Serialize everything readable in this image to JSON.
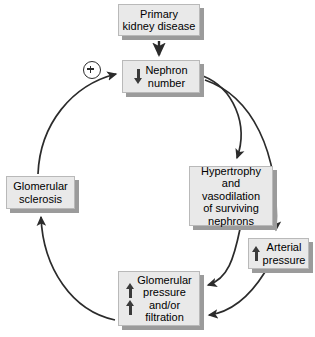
{
  "diagram": {
    "background_color": "#ffffff",
    "node_fill": "#e9e9e9",
    "node_shadow": "#9b9b9b",
    "arrow_color": "#2b2b2b",
    "nodes": [
      {
        "id": "primary",
        "label": "Primary\nkidney disease",
        "change_glyphs": []
      },
      {
        "id": "nephron",
        "label": "Nephron\nnumber",
        "change_glyphs": [
          "down"
        ]
      },
      {
        "id": "hypertrophy",
        "label": "Hypertrophy\nand vasodilation\nof surviving\nnephrons",
        "change_glyphs": []
      },
      {
        "id": "arterial",
        "label": "Arterial\npressure",
        "change_glyphs": [
          "up"
        ]
      },
      {
        "id": "glomerular_pressure",
        "label": "Glomerular\npressure\nand/or\nfiltration",
        "change_glyphs": [
          "up",
          "up"
        ]
      },
      {
        "id": "sclerosis",
        "label": "Glomerular\nsclerosis",
        "change_glyphs": []
      }
    ],
    "symbols": [
      {
        "id": "positive-feedback",
        "name": "plus-circle",
        "label": "+"
      }
    ],
    "edges": [
      {
        "from": "primary",
        "to": "nephron",
        "style": "straight"
      },
      {
        "from": "nephron",
        "to": "hypertrophy",
        "style": "curved"
      },
      {
        "from": "nephron",
        "to": "arterial",
        "style": "curved"
      },
      {
        "from": "hypertrophy",
        "to": "glomerular_pressure",
        "style": "curved"
      },
      {
        "from": "arterial",
        "to": "glomerular_pressure",
        "style": "curved"
      },
      {
        "from": "glomerular_pressure",
        "to": "sclerosis",
        "style": "curved"
      },
      {
        "from": "sclerosis",
        "to": "nephron",
        "style": "curved",
        "marker": "positive-feedback"
      }
    ]
  }
}
